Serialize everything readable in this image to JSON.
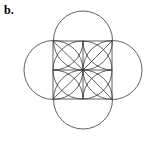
{
  "figure": {
    "label": "b.",
    "caption_prefix": "b.",
    "background_color": "#ffffff",
    "stroke_color": "#3a3a3a",
    "stroke_width": 0.8,
    "canvas": {
      "width": 162,
      "height": 147
    },
    "geometry": {
      "center": {
        "x": 83,
        "y": 70
      },
      "square": {
        "name": "bounding-square",
        "x": 53,
        "y": 41,
        "width": 59,
        "height": 58,
        "half_width": 29.5,
        "half_height": 29.0
      },
      "grid_lines": [
        {
          "name": "vertical-midline",
          "x1": 83,
          "y1": 41,
          "x2": 83,
          "y2": 99
        },
        {
          "name": "horizontal-midline",
          "x1": 53,
          "y1": 70,
          "x2": 112,
          "y2": 70
        }
      ],
      "circles": [
        {
          "name": "circle-top",
          "cx": 83,
          "cy": 40.5,
          "r": 29.5
        },
        {
          "name": "circle-bottom",
          "cx": 83,
          "cy": 99.5,
          "r": 29.5
        },
        {
          "name": "circle-left",
          "cx": 53.5,
          "cy": 70,
          "r": 29.5
        },
        {
          "name": "circle-right",
          "cx": 112.5,
          "cy": 70,
          "r": 29.5
        }
      ],
      "diagonals": [
        {
          "name": "diagonal-top-left",
          "x1": 53,
          "y1": 41,
          "x2": 83,
          "y2": 70
        },
        {
          "name": "diagonal-top-right",
          "x1": 112,
          "y1": 41,
          "x2": 83,
          "y2": 70
        },
        {
          "name": "diagonal-bottom-left",
          "x1": 53,
          "y1": 99,
          "x2": 83,
          "y2": 70
        },
        {
          "name": "diagonal-bottom-right",
          "x1": 112,
          "y1": 99,
          "x2": 83,
          "y2": 70
        }
      ],
      "petals": [
        {
          "name": "petal-top-left",
          "d": "M 83 41 A 29.5 29 0 0 0 53 70 A 29.5 29 0 0 0 83 41 Z"
        },
        {
          "name": "petal-top-right",
          "d": "M 83 41 A 29.5 29 0 0 1 112 70 A 29.5 29 0 0 1 83 41 Z"
        },
        {
          "name": "petal-bottom-right",
          "d": "M 112 70 A 29.5 29 0 0 1 83 99 A 29.5 29 0 0 1 112 70 Z"
        },
        {
          "name": "petal-bottom-left",
          "d": "M 83 99 A 29.5 29 0 0 1 53 70 A 29.5 29 0 0 1 83 99 Z"
        }
      ]
    }
  }
}
